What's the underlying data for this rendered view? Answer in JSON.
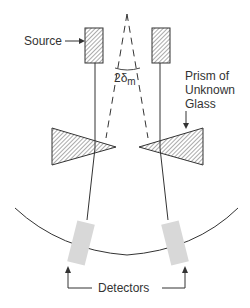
{
  "diagram": {
    "type": "optics-schematic",
    "labels": {
      "source": "Source",
      "angle_prefix": "2δ",
      "angle_subscript": "m",
      "prism_line1": "Prism of",
      "prism_line2": "Unknown",
      "prism_line3": "Glass",
      "detectors": "Detectors"
    },
    "colors": {
      "line": "#333333",
      "hatch": "#444444",
      "detector_fill": "#d8d8d8",
      "background": "#ffffff"
    }
  }
}
